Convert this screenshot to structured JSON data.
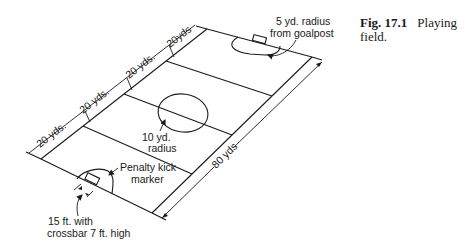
{
  "caption": {
    "figure_number": "Fig. 17.1",
    "title_line1": "Playing",
    "title_line2": "field."
  },
  "dimensions": {
    "segments": [
      "20 yds.",
      "20 yds.",
      "20 yds.",
      "20yds"
    ],
    "bottom_segment": "20 yds.",
    "length": "80 yds"
  },
  "annotations": {
    "goal_radius_line1": "5 yd. radius",
    "goal_radius_line2": "from goalpost",
    "center_radius_line1": "10 yd.",
    "center_radius_line2": "radius",
    "penalty_line1": "Penalty kick",
    "penalty_line2": "marker",
    "goal_size_line1": "15 ft. with",
    "goal_size_line2": "crossbar 7 ft. high"
  },
  "colors": {
    "ink": "#1a1a1a",
    "background": "#ffffff"
  }
}
